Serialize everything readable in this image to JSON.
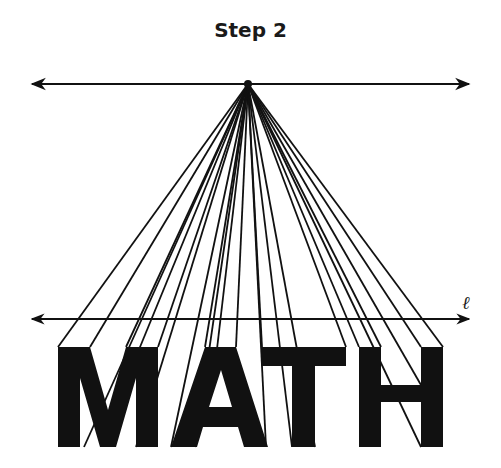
{
  "title": "Step 2",
  "line_label": "ℓ",
  "word": "MATH",
  "colors": {
    "ink": "#111111",
    "background": "#ffffff"
  },
  "vanishing_point": {
    "x": 248,
    "y": 84
  },
  "horizon_line": {
    "x1": 30,
    "x2": 471,
    "y": 84
  },
  "line_l": {
    "x1": 30,
    "x2": 471,
    "y": 319
  }
}
